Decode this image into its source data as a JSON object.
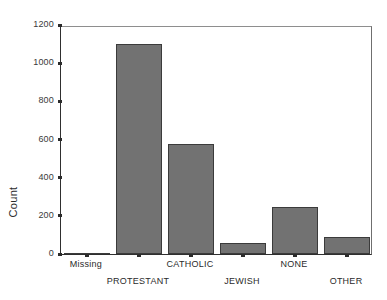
{
  "chart_data": {
    "type": "bar",
    "title": "",
    "subtitle": "",
    "xlabel": "",
    "ylabel": "Count",
    "categories": [
      "Missing",
      "PROTESTANT",
      "CATHOLIC",
      "JEWISH",
      "NONE",
      "OTHER"
    ],
    "values": [
      0,
      1102,
      576,
      58,
      246,
      89
    ],
    "ylim": [
      0,
      1200
    ],
    "ytick_labels": [
      "0",
      "200",
      "400",
      "600",
      "800",
      "1000",
      "1200"
    ],
    "ytick_values": [
      0,
      200,
      400,
      600,
      800,
      1000,
      1200
    ],
    "grid": false,
    "legend": null,
    "legend_position": "none",
    "bar_fill_color": "#727272",
    "bar_border_color": "#3b3b3b",
    "axis_color": "#2b2b2b",
    "background_color": "#ffffff",
    "label_rows": [
      "top",
      "bottom",
      "top",
      "bottom",
      "top",
      "bottom"
    ]
  }
}
